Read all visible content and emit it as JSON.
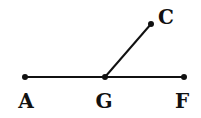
{
  "diagram": {
    "points": [
      {
        "id": "A",
        "label": "A",
        "x": 25,
        "y": 77,
        "lx": 26,
        "ly": 108
      },
      {
        "id": "G",
        "label": "G",
        "x": 105,
        "y": 77,
        "lx": 104,
        "ly": 108
      },
      {
        "id": "F",
        "label": "F",
        "x": 184,
        "y": 77,
        "lx": 182,
        "ly": 108
      },
      {
        "id": "C",
        "label": "C",
        "x": 151,
        "y": 24,
        "lx": 166,
        "ly": 24
      }
    ],
    "segments": [
      {
        "from": "A",
        "to": "F"
      },
      {
        "from": "G",
        "to": "C"
      }
    ],
    "colors": {
      "stroke": "#111111",
      "background": "#ffffff"
    }
  }
}
